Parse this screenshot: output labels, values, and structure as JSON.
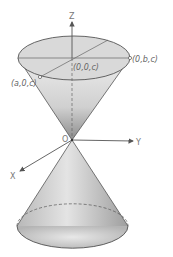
{
  "diagram": {
    "type": "double-cone",
    "axes": {
      "z_label": "Z",
      "y_label": "Y",
      "x_label": "X",
      "origin_label": "O"
    },
    "points": {
      "top_center": "(0,0,c)",
      "top_b": "(0,b,c)",
      "top_a": "(a,0,c)"
    },
    "colors": {
      "line": "#555555",
      "fill_light": "#e6e6e6",
      "fill_dark": "#9a9a9a",
      "label": "#666666"
    }
  }
}
